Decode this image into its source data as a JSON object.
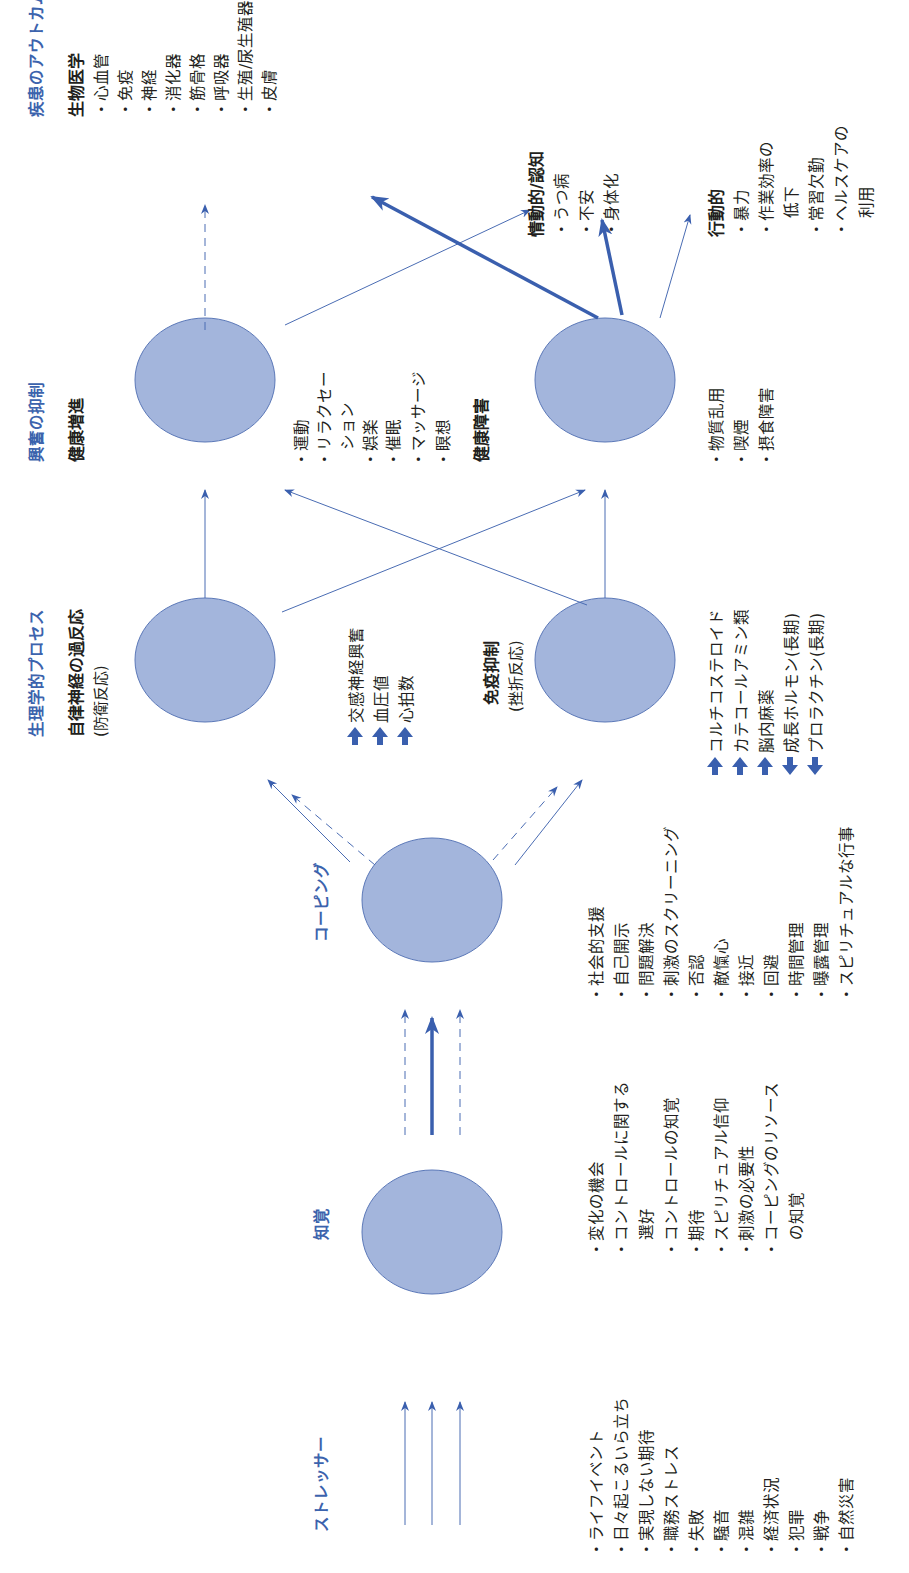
{
  "diagram": {
    "orientation": "rotated-90-ccw",
    "colors": {
      "header_blue": "#3c63ad",
      "ellipse_fill": "#a3b5dc",
      "ellipse_stroke": "#5b78b8",
      "arrow_blue": "#3a5fae",
      "text": "#231f20"
    },
    "stages": {
      "stressor": {
        "header": "ストレッサー",
        "items": [
          "・ライフイベント",
          "・日々起こるいら立ち",
          "・実現しない期待",
          "・職務ストレス",
          "・失敗",
          "・騒音",
          "・混雑",
          "・経済状況",
          "・犯罪",
          "・戦争",
          "・自然災害"
        ]
      },
      "perception": {
        "header": "知覚",
        "items": [
          "・変化の機会",
          "・コントロールに関する",
          "選好",
          "・コントロールの知覚",
          "・期待",
          "・スピリチュアル信仰",
          "・刺激の必要性",
          "・コーピングのリソース",
          "の知覚"
        ]
      },
      "coping": {
        "header": "コーピング",
        "items": [
          "・社会的支援",
          "・自己開示",
          "・問題解決",
          "・刺激のスクリーニング",
          "・否認",
          "・敵愾心",
          "・接近",
          "・回避",
          "・時間管理",
          "・曝露管理",
          "・スピリチュアルな行事"
        ]
      },
      "physiological": {
        "header": "生理学的プロセス",
        "autonomic": {
          "title": "自律神経の過反応",
          "subtitle": "(防衛反応)",
          "effects": [
            {
              "dir": "up",
              "label": "交感神経興奮"
            },
            {
              "dir": "up",
              "label": "血圧値"
            },
            {
              "dir": "up",
              "label": "心拍数"
            }
          ]
        },
        "immune": {
          "title": "免疫抑制",
          "subtitle": "(挫折反応)",
          "effects": [
            {
              "dir": "up",
              "label": "コルチコステロイド"
            },
            {
              "dir": "up",
              "label": "カテコールアミン類"
            },
            {
              "dir": "up",
              "label": "脳内麻薬"
            },
            {
              "dir": "down",
              "label": "成長ホルモン(長期)"
            },
            {
              "dir": "down",
              "label": "プロラクチン(長期)"
            }
          ]
        }
      },
      "arousal_suppression": {
        "header": "興奮の抑制",
        "promotion": {
          "title": "健康増進",
          "items": [
            "・運動",
            "・リラクセー",
            "ション",
            "・娯楽",
            "・催眠",
            "・マッサージ",
            "・瞑想"
          ]
        },
        "impairment": {
          "title": "健康障害",
          "items": [
            "・物質乱用",
            "・喫煙",
            "・摂食障害"
          ]
        }
      },
      "outcomes": {
        "header": "疾患のアウトカム",
        "biomedical": {
          "title": "生物医学",
          "items": [
            "・心血管",
            "・免疫",
            "・神経",
            "・消化器",
            "・筋骨格",
            "・呼吸器",
            "・生殖/尿生殖器",
            "・皮膚"
          ]
        },
        "emotional": {
          "title": "情動的/認知",
          "items": [
            "・うつ病",
            "・不安",
            "・身体化"
          ]
        },
        "behavioral": {
          "title": "行動的",
          "items": [
            "・暴力",
            "・作業効率の",
            "低下",
            "・常習欠勤",
            "・ヘルスケアの",
            "利用"
          ]
        }
      }
    },
    "icons": {
      "up": "↑",
      "down": "↓"
    }
  }
}
